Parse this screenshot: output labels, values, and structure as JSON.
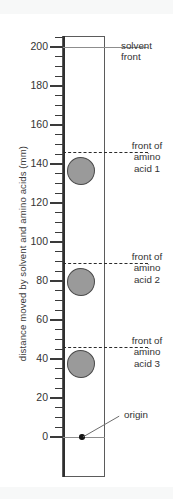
{
  "figure": {
    "type": "chromatogram-diagram",
    "y_axis_title": "distance moved by solvent and amino acids (mm)"
  },
  "chart_data": {
    "type": "scatter",
    "title": "",
    "xlabel": "",
    "ylabel": "distance moved by solvent and amino acids (mm)",
    "ylim": [
      0,
      210
    ],
    "y_ticks_major": [
      0,
      20,
      40,
      60,
      80,
      100,
      120,
      140,
      160,
      180,
      200
    ],
    "y_tick_minor_step": 5,
    "grid": false,
    "legend": false,
    "annotations": [
      {
        "name": "solvent front",
        "value": 200
      },
      {
        "name": "front of amino acid 1",
        "value": 146
      },
      {
        "name": "front of amino acid 2",
        "value": 89
      },
      {
        "name": "front of amino acid 3",
        "value": 46
      },
      {
        "name": "origin",
        "value": 0
      }
    ],
    "series": [
      {
        "name": "amino acid 1",
        "spot_center": 140,
        "spot_front": 146,
        "spot_base": 133
      },
      {
        "name": "amino acid 2",
        "spot_center": 83,
        "spot_front": 89,
        "spot_base": 76
      },
      {
        "name": "amino acid 3",
        "spot_center": 41,
        "spot_front": 46,
        "spot_base": 33
      }
    ]
  },
  "axis": {
    "title": "distance moved by solvent and amino acids (mm)",
    "ticks": [
      {
        "label": "200",
        "value": 200
      },
      {
        "label": "180",
        "value": 180
      },
      {
        "label": "160",
        "value": 160
      },
      {
        "label": "140",
        "value": 140
      },
      {
        "label": "120",
        "value": 120
      },
      {
        "label": "100",
        "value": 100
      },
      {
        "label": "80",
        "value": 80
      },
      {
        "label": "60",
        "value": 60
      },
      {
        "label": "40",
        "value": 40
      },
      {
        "label": "20",
        "value": 20
      },
      {
        "label": "0",
        "value": 0
      }
    ]
  },
  "labels": {
    "solvent_front": "solvent\nfront",
    "solvent_front_line1": "solvent",
    "solvent_front_line2": "front",
    "acid1_line1": "front of",
    "acid1_line2": "amino",
    "acid1_line3": "acid 1",
    "acid2_line1": "front of",
    "acid2_line2": "amino",
    "acid2_line3": "acid 2",
    "acid3_line1": "front of",
    "acid3_line2": "amino",
    "acid3_line3": "acid 3",
    "origin": "origin"
  },
  "colors": {
    "spot_fill": "#9a9a9a",
    "spot_stroke": "#4a4a4a",
    "axis": "#2f2f2f",
    "plate_stroke": "#5b5b5b",
    "text": "#333333",
    "background": "#ffffff",
    "band": "#f7f8f8"
  }
}
